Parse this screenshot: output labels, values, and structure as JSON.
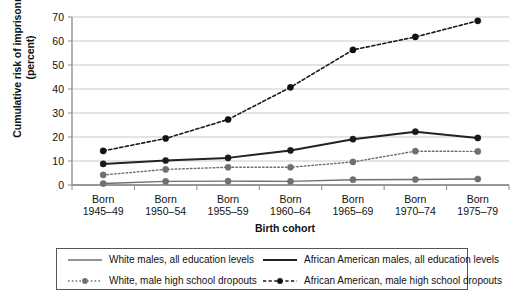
{
  "chart_data": {
    "type": "line",
    "title": "",
    "xlabel": "Birth cohort",
    "ylabel": "Cumulative risk of imprisonment (percent)",
    "ylabel_line1": "Cumulative risk of imprisonment",
    "ylabel_line2": "(percent)",
    "categories": [
      "Born 1945–49",
      "Born 1950–54",
      "Born 1955–59",
      "Born 1960–64",
      "Born 1965–69",
      "Born 1970–74",
      "Born 1975–79"
    ],
    "category_lines": [
      {
        "l1": "Born",
        "l2": "1945–49"
      },
      {
        "l1": "Born",
        "l2": "1950–54"
      },
      {
        "l1": "Born",
        "l2": "1955–59"
      },
      {
        "l1": "Born",
        "l2": "1960–64"
      },
      {
        "l1": "Born",
        "l2": "1965–69"
      },
      {
        "l1": "Born",
        "l2": "1970–74"
      },
      {
        "l1": "Born",
        "l2": "1975–79"
      }
    ],
    "ylim": [
      0,
      70
    ],
    "yticks": [
      0,
      10,
      20,
      30,
      40,
      50,
      60,
      70
    ],
    "ytick_labels": [
      "0",
      "10",
      "20",
      "30",
      "40",
      "50",
      "60",
      "70"
    ],
    "grid": true,
    "legend_position": "below",
    "series": [
      {
        "name": "White males, all education levels",
        "values": [
          0.6,
          1.5,
          1.6,
          1.5,
          2.2,
          2.3,
          2.5
        ],
        "color": "#6e6e6e",
        "style": "solid",
        "marker": true,
        "marker_color": "#707070",
        "width": 1.4
      },
      {
        "name": "African American males, all education levels",
        "values": [
          8.8,
          10.2,
          11.3,
          14.4,
          19.1,
          22.2,
          19.6
        ],
        "color": "#222222",
        "style": "solid",
        "marker": true,
        "marker_color": "#1a1a1a",
        "width": 2.0
      },
      {
        "name": "White, male high school dropouts",
        "values": [
          4.2,
          6.5,
          7.4,
          7.4,
          9.6,
          14.1,
          14.0
        ],
        "color": "#6e6e6e",
        "style": "dotted",
        "marker": true,
        "marker_color": "#707070",
        "width": 1.4
      },
      {
        "name": "African American, male high school dropouts",
        "values": [
          14.2,
          19.4,
          27.3,
          40.7,
          56.3,
          61.7,
          68.4
        ],
        "color": "#1a1a1a",
        "style": "dashed",
        "marker": true,
        "marker_color": "#111111",
        "width": 1.6
      }
    ]
  },
  "legend": {
    "items": [
      {
        "label": "White males, all education levels"
      },
      {
        "label": "African American males, all education levels"
      },
      {
        "label": "White, male high school dropouts"
      },
      {
        "label": "African American, male high school dropouts"
      }
    ]
  }
}
